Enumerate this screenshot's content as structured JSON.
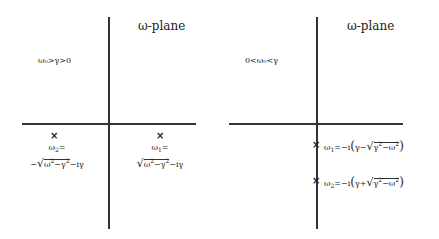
{
  "left_panel": {
    "title": "ω-plane",
    "condition": "ω₀>γ>0",
    "poles": [
      {
        "name": "ω₂",
        "label_line1": "ω₂=",
        "label_line2": "−√(ω₀²−γ²)−iγ",
        "minus": "−",
        "rad_a": "ω",
        "rad_a_sub": "0",
        "rad_a_sup": "2",
        "rad_op": "−γ",
        "rad_b_sup": "2",
        "tail": "−iγ",
        "eq_name": "ω",
        "eq_sub": "2",
        "eq": "="
      },
      {
        "name": "ω₁",
        "label_line1": "ω₁=",
        "label_line2": "√(ω₀²−γ²)−iγ",
        "rad_a": "ω",
        "rad_a_sub": "0",
        "rad_a_sup": "2",
        "rad_op": "−γ",
        "rad_b_sup": "2",
        "tail": "−iγ",
        "eq_name": "ω",
        "eq_sub": "1",
        "eq": "="
      }
    ]
  },
  "right_panel": {
    "title": "ω-plane",
    "condition": "0<ω₀<γ",
    "poles": [
      {
        "name": "ω₁",
        "label": "ω₁=−i(γ−√(γ²−ω₀²))",
        "eq_name": "ω",
        "eq_sub": "1",
        "pre": "=−i",
        "inner_a": "γ",
        "sign": "−",
        "rad": "γ",
        "rad_sup": "2",
        "rad_op": "−ω",
        "rad_sub": "0",
        "rad_sup2": "2"
      },
      {
        "name": "ω₂",
        "label": "ω₂=−i(γ+√(γ²−ω₀²))",
        "eq_name": "ω",
        "eq_sub": "2",
        "pre": "=−i",
        "inner_a": "γ",
        "sign": "+",
        "rad": "γ",
        "rad_sup": "2",
        "rad_op": "−ω",
        "rad_sub": "0",
        "rad_sup2": "2"
      }
    ]
  },
  "marker_glyph": "×"
}
